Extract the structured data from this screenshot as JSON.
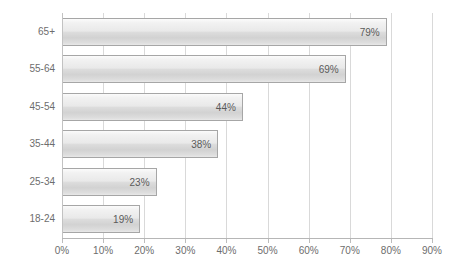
{
  "chart_data": {
    "type": "bar",
    "orientation": "horizontal",
    "title": "",
    "subtitle": "",
    "xlabel": "",
    "ylabel": "",
    "categories": [
      "18-24",
      "25-34",
      "35-44",
      "45-54",
      "55-64",
      "65+"
    ],
    "values": [
      19,
      23,
      38,
      44,
      69,
      79
    ],
    "data_labels": [
      "19%",
      "23%",
      "38%",
      "44%",
      "69%",
      "79%"
    ],
    "xlim": [
      0,
      90
    ],
    "xtick_values": [
      0,
      10,
      20,
      30,
      40,
      50,
      60,
      70,
      80,
      90
    ],
    "xtick_labels": [
      "0%",
      "10%",
      "20%",
      "30%",
      "40%",
      "50%",
      "60%",
      "70%",
      "80%",
      "90%"
    ],
    "grid": "vertical",
    "legend": "none",
    "series": [
      {
        "name": "",
        "values": [
          19,
          23,
          38,
          44,
          69,
          79
        ]
      }
    ],
    "colors": {
      "bar_fill_light": "#fbfbfb",
      "bar_fill_mid": "#dcdcdc",
      "bar_fill_dark": "#d2d2d2",
      "bar_border": "#a6a6a6",
      "gridline": "#d9d9d9",
      "axis_line": "#b6b6b6",
      "label_text": "#6d6d6d",
      "data_label_text": "#5a5a5a",
      "background": "#ffffff"
    }
  },
  "bars_top_to_bottom": [
    {
      "category": "65+",
      "value": 79,
      "label": "79%"
    },
    {
      "category": "55-64",
      "value": 69,
      "label": "69%"
    },
    {
      "category": "45-54",
      "value": 44,
      "label": "44%"
    },
    {
      "category": "35-44",
      "value": 38,
      "label": "38%"
    },
    {
      "category": "25-34",
      "value": 23,
      "label": "23%"
    },
    {
      "category": "18-24",
      "value": 19,
      "label": "19%"
    }
  ]
}
